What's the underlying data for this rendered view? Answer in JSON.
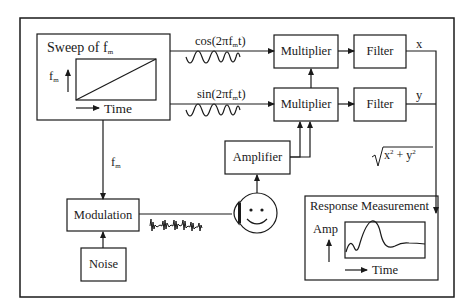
{
  "diagram": {
    "sweep_box": {
      "title": "Sweep of f",
      "title_sub": "m",
      "y_axis_label": "f",
      "y_axis_sub": "m",
      "x_axis_label": "Time"
    },
    "signals": {
      "cos_label": "cos(2πf",
      "cos_sub": "m",
      "cos_tail": "t)",
      "sin_label": "sin(2πf",
      "sin_sub": "m",
      "sin_tail": "t)",
      "fm_label": "f",
      "fm_sub": "m",
      "x_label": "x",
      "y_label": "y",
      "magnitude_label": "x",
      "magnitude_mid": " + y",
      "magnitude_sup": "2"
    },
    "blocks": {
      "multiplier_top": "Multiplier",
      "multiplier_bottom": "Multiplier",
      "filter_top": "Filter",
      "filter_bottom": "Filter",
      "amplifier": "Amplifier",
      "modulation": "Modulation",
      "noise": "Noise"
    },
    "response_box": {
      "title": "Response Measurement",
      "y_axis_label": "Amp",
      "x_axis_label": "Time"
    },
    "colors": {
      "stroke": "#1a1a1a",
      "background": "#ffffff"
    }
  }
}
